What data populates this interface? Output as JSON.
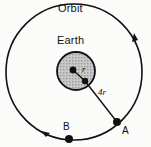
{
  "figure": {
    "background_color": "#fbfbfa",
    "stroke_color": "#111111",
    "earth_fill_color": "#b3b3b3",
    "labels": {
      "orbit": "Orbit",
      "earth": "Earth",
      "radius_earth": "r",
      "orbit_radius": "4r",
      "point_a": "A",
      "point_b": "B"
    },
    "geometry": {
      "orbit_center_x": 74,
      "orbit_center_y": 72,
      "orbit_radius": 68,
      "earth_center_x": 76,
      "earth_center_y": 71,
      "earth_radius": 19,
      "point_a_x": 117,
      "point_a_y": 122,
      "point_b_x": 71,
      "point_b_y": 138,
      "direction_of_motion": "clockwise"
    }
  }
}
